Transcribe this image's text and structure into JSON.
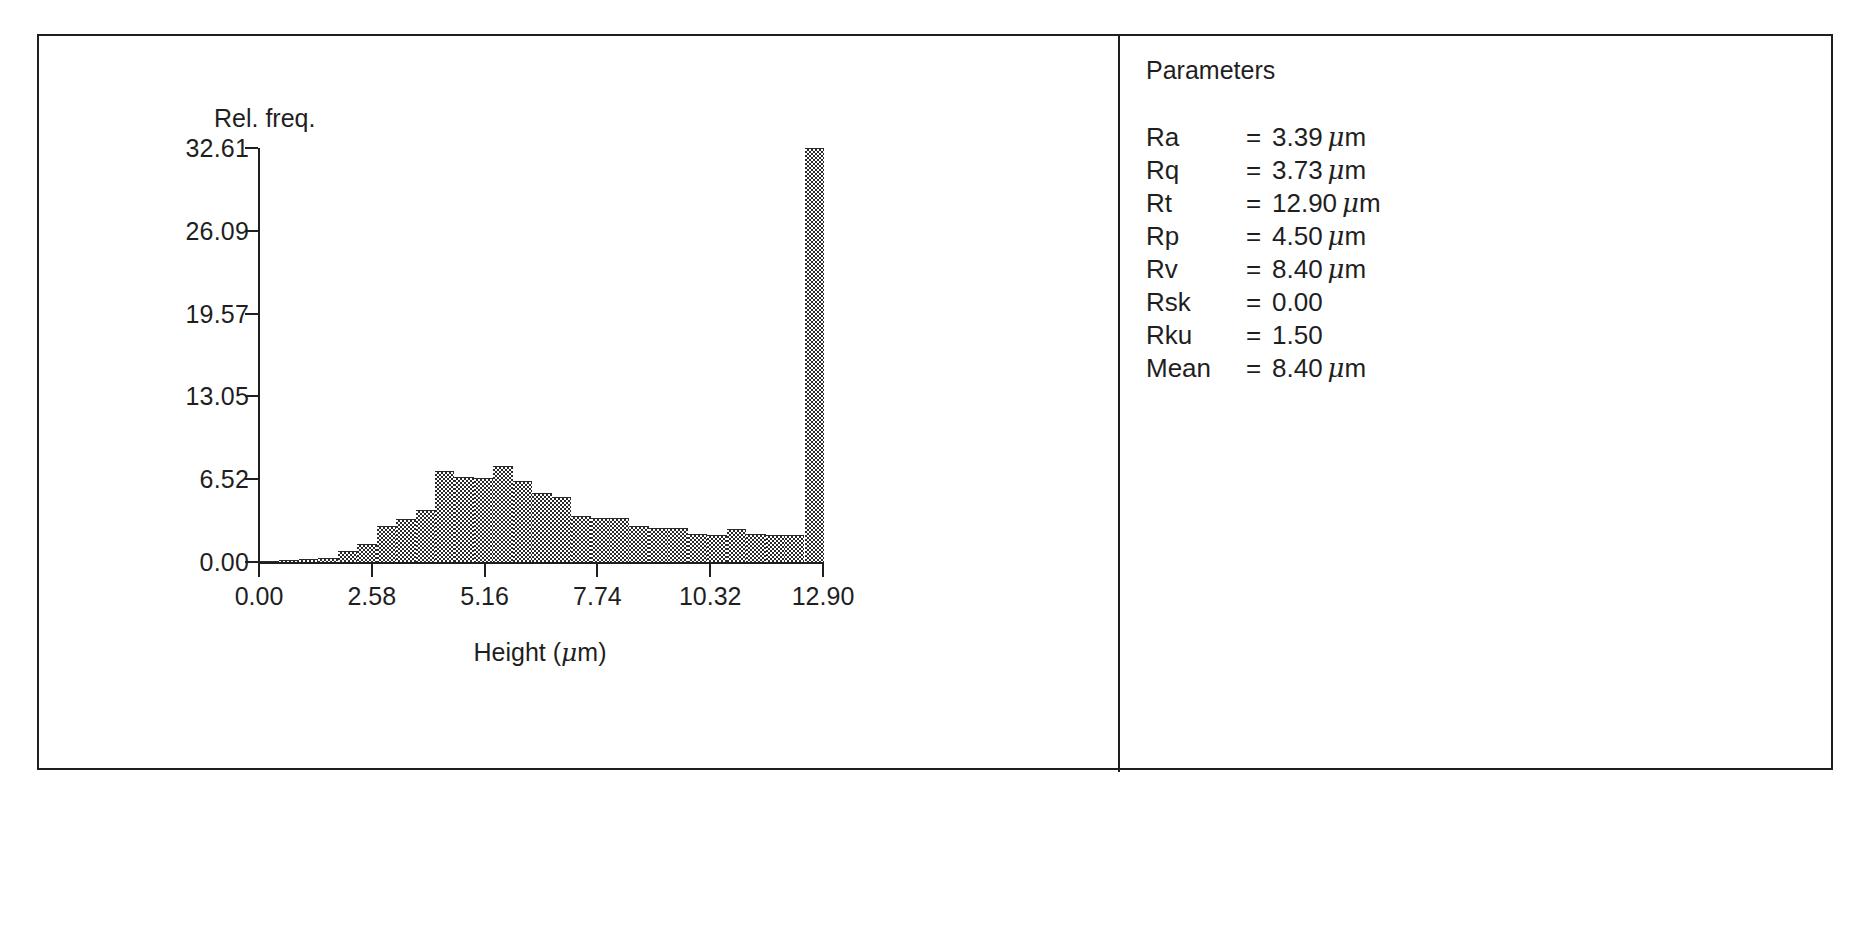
{
  "panels": {
    "chart": {
      "name": "height-distribution-histogram"
    },
    "parameters": {
      "title": "Parameters",
      "rows": [
        {
          "name": "Ra",
          "eq": "=",
          "value": "3.39",
          "unit": "μm"
        },
        {
          "name": "Rq",
          "eq": "=",
          "value": "3.73",
          "unit": "μm"
        },
        {
          "name": "Rt",
          "eq": "=",
          "value": "12.90",
          "unit": "μm"
        },
        {
          "name": "Rp",
          "eq": "=",
          "value": "4.50",
          "unit": "μm"
        },
        {
          "name": "Rv",
          "eq": "=",
          "value": "8.40",
          "unit": "μm"
        },
        {
          "name": "Rsk",
          "eq": "=",
          "value": "0.00",
          "unit": ""
        },
        {
          "name": "Rku",
          "eq": "=",
          "value": "1.50",
          "unit": ""
        },
        {
          "name": "Mean",
          "eq": "=",
          "value": "8.40",
          "unit": "μm"
        }
      ]
    }
  },
  "chart_data": {
    "type": "bar",
    "title": "",
    "subtitle": "",
    "xlabel": "Height (μm)",
    "ylabel": "Rel. freq.",
    "grid": false,
    "legend": null,
    "xlim": [
      0.0,
      12.9
    ],
    "ylim": [
      0.0,
      32.61
    ],
    "xticks": [
      "0.00",
      "2.58",
      "5.16",
      "7.74",
      "10.32",
      "12.90"
    ],
    "xtick_values": [
      0.0,
      2.58,
      5.16,
      7.74,
      10.32,
      12.9
    ],
    "yticks": [
      "0.00",
      "6.52",
      "13.05",
      "19.57",
      "26.09",
      "32.61"
    ],
    "ytick_values": [
      0.0,
      6.52,
      13.05,
      19.57,
      26.09,
      32.61
    ],
    "bin_width": 0.4448,
    "bin_edges": [
      0.0,
      0.445,
      0.89,
      1.334,
      1.779,
      2.224,
      2.669,
      3.114,
      3.558,
      4.003,
      4.448,
      4.893,
      5.338,
      5.782,
      6.227,
      6.672,
      7.117,
      7.562,
      8.006,
      8.451,
      8.896,
      9.341,
      9.786,
      10.23,
      10.675,
      11.12,
      11.565,
      12.01,
      12.454,
      12.9
    ],
    "categories": [
      "0.00-0.44",
      "0.44-0.89",
      "0.89-1.33",
      "1.33-1.78",
      "1.78-2.22",
      "2.22-2.67",
      "2.67-3.11",
      "3.11-3.56",
      "3.56-4.00",
      "4.00-4.45",
      "4.45-4.89",
      "4.89-5.34",
      "5.34-5.78",
      "5.78-6.23",
      "6.23-6.67",
      "6.67-7.12",
      "7.12-7.56",
      "7.56-8.01",
      "8.01-8.45",
      "8.45-8.90",
      "8.90-9.34",
      "9.34-9.79",
      "9.79-10.23",
      "10.23-10.68",
      "10.68-11.12",
      "11.12-11.57",
      "11.57-12.01",
      "12.01-12.45",
      "12.45-12.90"
    ],
    "values": [
      0.1,
      0.15,
      0.2,
      0.3,
      0.9,
      1.4,
      2.8,
      3.4,
      4.1,
      7.2,
      6.7,
      6.6,
      7.6,
      6.4,
      5.4,
      5.1,
      3.6,
      3.5,
      3.5,
      2.8,
      2.7,
      2.7,
      2.2,
      2.1,
      2.6,
      2.2,
      2.1,
      2.1,
      32.61
    ],
    "series": [
      {
        "name": "Rel. freq.",
        "values": [
          0.1,
          0.15,
          0.2,
          0.3,
          0.9,
          1.4,
          2.8,
          3.4,
          4.1,
          7.2,
          6.7,
          6.6,
          7.6,
          6.4,
          5.4,
          5.1,
          3.6,
          3.5,
          3.5,
          2.8,
          2.7,
          2.7,
          2.2,
          2.1,
          2.6,
          2.2,
          2.1,
          2.1,
          32.61
        ]
      }
    ]
  }
}
